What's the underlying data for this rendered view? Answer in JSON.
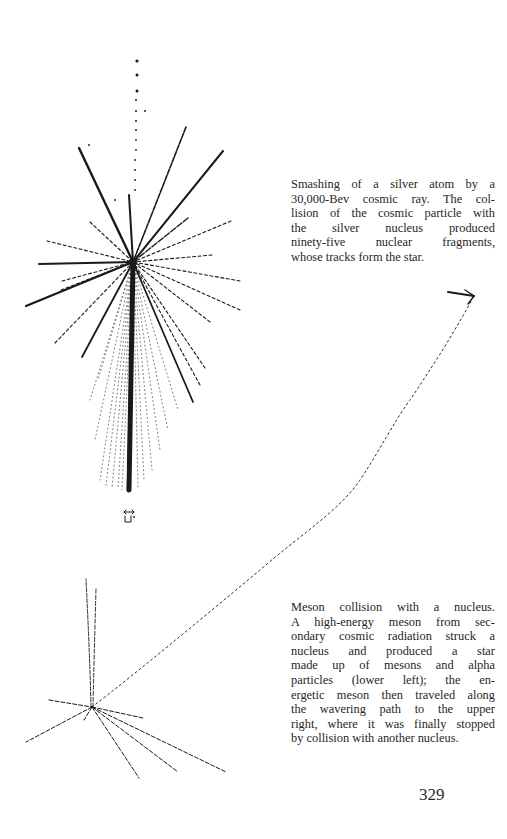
{
  "page": {
    "page_number": "329"
  },
  "figures": [
    {
      "id": "star",
      "description": "Cosmic ray star in emulsion (silver atom)",
      "caption_lines": [
        "Smashing of a silver atom by a",
        "30,000-Bev cosmic ray. The col-",
        "lision of the cosmic particle with",
        "the silver nucleus produced",
        "ninety-five nuclear fragments,",
        "whose tracks form the star."
      ],
      "scale_marker": "↔ μ"
    },
    {
      "id": "meson-collision",
      "description": "Meson collision track and star, lower left with path to upper right",
      "caption_lines": [
        "Meson collision with a nucleus.",
        "A high-energy meson from sec-",
        "ondary cosmic radiation struck a",
        "nucleus and produced a star",
        "made up of mesons and alpha",
        "particles (lower left); the en-",
        "ergetic meson then traveled along",
        "the wavering path to the upper",
        "right, where it was finally stopped",
        "by collision with another nucleus."
      ]
    }
  ],
  "colors": {
    "ink": "#1a1a1a",
    "paper": "#ffffff",
    "text": "#262626"
  }
}
